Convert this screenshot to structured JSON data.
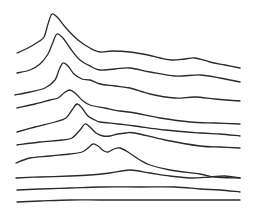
{
  "chart_data": {
    "type": "line",
    "subtype": "waterfall / stacked ridgeline",
    "title": "",
    "xlabel": "",
    "ylabel": "",
    "grid": false,
    "legend": null,
    "stroke_color": "#2a2a2a",
    "background": "#ffffff",
    "series": [
      {
        "name": "trace-1",
        "points": [
          [
            17,
            53
          ],
          [
            28,
            48
          ],
          [
            38,
            42
          ],
          [
            44,
            37
          ],
          [
            48,
            24
          ],
          [
            52,
            14
          ],
          [
            58,
            18
          ],
          [
            66,
            28
          ],
          [
            78,
            40
          ],
          [
            90,
            48
          ],
          [
            100,
            52
          ],
          [
            112,
            51
          ],
          [
            130,
            52
          ],
          [
            148,
            55
          ],
          [
            160,
            58
          ],
          [
            172,
            60
          ],
          [
            185,
            59
          ],
          [
            195,
            58
          ],
          [
            210,
            62
          ],
          [
            225,
            65
          ],
          [
            240,
            68
          ]
        ]
      },
      {
        "name": "trace-2",
        "points": [
          [
            17,
            73
          ],
          [
            30,
            70
          ],
          [
            40,
            64
          ],
          [
            48,
            54
          ],
          [
            53,
            42
          ],
          [
            57,
            34
          ],
          [
            63,
            38
          ],
          [
            70,
            48
          ],
          [
            80,
            60
          ],
          [
            92,
            67
          ],
          [
            100,
            70
          ],
          [
            115,
            69
          ],
          [
            130,
            68
          ],
          [
            150,
            72
          ],
          [
            175,
            76
          ],
          [
            200,
            75
          ],
          [
            220,
            78
          ],
          [
            240,
            82
          ]
        ]
      },
      {
        "name": "trace-3",
        "points": [
          [
            15,
            95
          ],
          [
            30,
            92
          ],
          [
            45,
            88
          ],
          [
            55,
            80
          ],
          [
            59,
            70
          ],
          [
            63,
            63
          ],
          [
            68,
            66
          ],
          [
            74,
            74
          ],
          [
            82,
            79
          ],
          [
            90,
            80
          ],
          [
            100,
            84
          ],
          [
            115,
            86
          ],
          [
            130,
            88
          ],
          [
            150,
            94
          ],
          [
            175,
            98
          ],
          [
            195,
            97
          ],
          [
            215,
            99
          ],
          [
            240,
            101
          ]
        ]
      },
      {
        "name": "trace-4",
        "points": [
          [
            17,
            108
          ],
          [
            35,
            104
          ],
          [
            50,
            100
          ],
          [
            58,
            98
          ],
          [
            64,
            93
          ],
          [
            70,
            90
          ],
          [
            76,
            94
          ],
          [
            82,
            100
          ],
          [
            90,
            105
          ],
          [
            105,
            108
          ],
          [
            120,
            111
          ],
          [
            135,
            113
          ],
          [
            160,
            118
          ],
          [
            190,
            122
          ],
          [
            215,
            123
          ],
          [
            240,
            124
          ]
        ]
      },
      {
        "name": "trace-5",
        "points": [
          [
            17,
            132
          ],
          [
            35,
            127
          ],
          [
            55,
            122
          ],
          [
            66,
            118
          ],
          [
            72,
            110
          ],
          [
            77,
            104
          ],
          [
            82,
            108
          ],
          [
            88,
            116
          ],
          [
            95,
            120
          ],
          [
            100,
            122
          ],
          [
            118,
            124
          ],
          [
            135,
            126
          ],
          [
            165,
            130
          ],
          [
            200,
            133
          ],
          [
            220,
            134
          ],
          [
            240,
            136
          ]
        ]
      },
      {
        "name": "trace-6",
        "points": [
          [
            17,
            145
          ],
          [
            40,
            142
          ],
          [
            62,
            140
          ],
          [
            72,
            138
          ],
          [
            80,
            130
          ],
          [
            85,
            124
          ],
          [
            90,
            127
          ],
          [
            96,
            133
          ],
          [
            103,
            136
          ],
          [
            110,
            136
          ],
          [
            118,
            134
          ],
          [
            126,
            133
          ],
          [
            135,
            133
          ],
          [
            165,
            140
          ],
          [
            200,
            146
          ],
          [
            220,
            147
          ],
          [
            240,
            148
          ]
        ]
      },
      {
        "name": "trace-7",
        "points": [
          [
            16,
            163
          ],
          [
            30,
            158
          ],
          [
            50,
            156
          ],
          [
            70,
            154
          ],
          [
            82,
            152
          ],
          [
            88,
            148
          ],
          [
            93,
            144
          ],
          [
            98,
            146
          ],
          [
            104,
            151
          ],
          [
            108,
            152
          ],
          [
            114,
            149
          ],
          [
            120,
            148
          ],
          [
            128,
            152
          ],
          [
            140,
            160
          ],
          [
            150,
            165
          ],
          [
            170,
            170
          ],
          [
            200,
            174
          ],
          [
            215,
            177
          ],
          [
            240,
            178
          ]
        ]
      },
      {
        "name": "trace-8",
        "points": [
          [
            16,
            178
          ],
          [
            40,
            177
          ],
          [
            70,
            176
          ],
          [
            90,
            175
          ],
          [
            110,
            173
          ],
          [
            130,
            170
          ],
          [
            150,
            173
          ],
          [
            170,
            176
          ],
          [
            190,
            178
          ],
          [
            210,
            177
          ],
          [
            225,
            176
          ],
          [
            240,
            178
          ]
        ]
      },
      {
        "name": "trace-9",
        "points": [
          [
            17,
            190
          ],
          [
            40,
            189
          ],
          [
            70,
            188
          ],
          [
            100,
            187
          ],
          [
            140,
            187
          ],
          [
            175,
            187
          ],
          [
            200,
            189
          ],
          [
            220,
            190
          ],
          [
            240,
            192
          ]
        ]
      },
      {
        "name": "trace-10",
        "points": [
          [
            17,
            202
          ],
          [
            40,
            201
          ],
          [
            70,
            200
          ],
          [
            100,
            200
          ],
          [
            140,
            200
          ],
          [
            175,
            200
          ],
          [
            210,
            200
          ],
          [
            240,
            200
          ]
        ]
      }
    ]
  }
}
